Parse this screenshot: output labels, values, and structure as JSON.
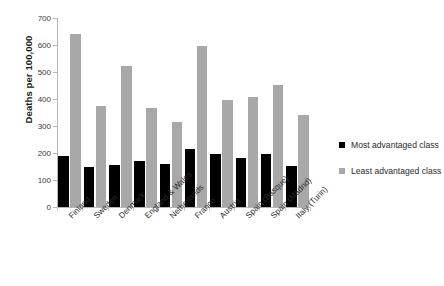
{
  "chart_data": {
    "type": "bar",
    "title": "",
    "xlabel": "",
    "ylabel": "Deaths per 100,000",
    "ylim": [
      0,
      700
    ],
    "yticks": [
      0,
      100,
      200,
      300,
      400,
      500,
      600,
      700
    ],
    "grid": false,
    "legend_position": "right",
    "categories": [
      "Finland",
      "Sweden",
      "Denmark",
      "England & Wales",
      "Netherlands",
      "France",
      "Austria",
      "Spain (Basque)",
      "Spain (Madrid)",
      "Italy (Turin)"
    ],
    "series": [
      {
        "name": "Most advantaged class",
        "color": "#000000",
        "values": [
          188,
          148,
          155,
          172,
          158,
          215,
          196,
          180,
          198,
          153
        ]
      },
      {
        "name": "Least advantaged class",
        "color": "#a8a8a8",
        "values": [
          641,
          374,
          523,
          368,
          316,
          595,
          396,
          408,
          452,
          341
        ]
      }
    ]
  },
  "legend": {
    "items": [
      {
        "label": "Most advantaged class",
        "swatch": "most"
      },
      {
        "label": "Least advantaged class",
        "swatch": "least"
      }
    ]
  }
}
